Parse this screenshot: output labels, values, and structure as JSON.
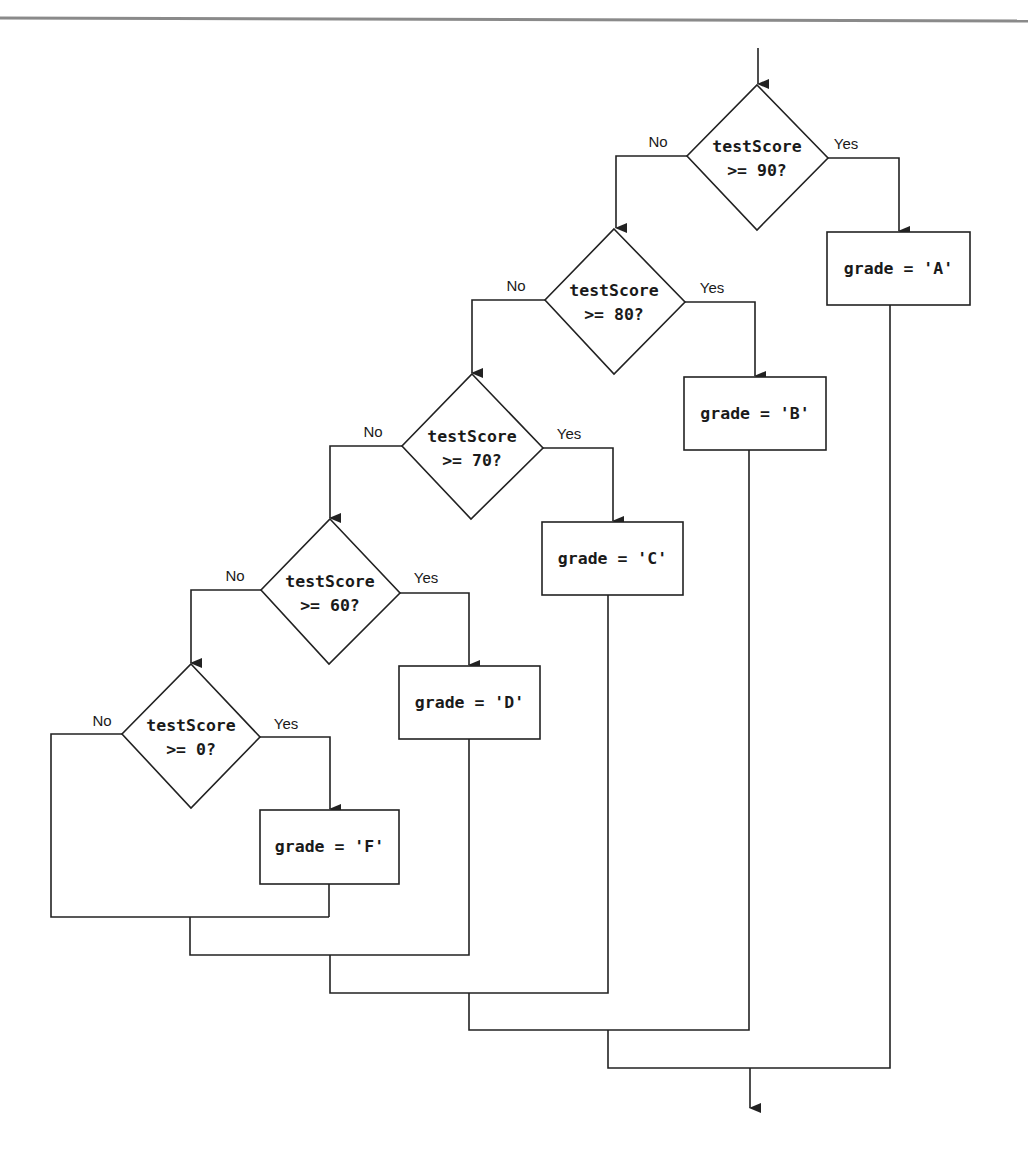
{
  "diagram": {
    "type": "flowchart",
    "decisions": [
      {
        "id": "d90",
        "line1": "testScore",
        "line2": ">= 90?",
        "no_label": "No",
        "yes_label": "Yes"
      },
      {
        "id": "d80",
        "line1": "testScore",
        "line2": ">= 80?",
        "no_label": "No",
        "yes_label": "Yes"
      },
      {
        "id": "d70",
        "line1": "testScore",
        "line2": ">= 70?",
        "no_label": "No",
        "yes_label": "Yes"
      },
      {
        "id": "d60",
        "line1": "testScore",
        "line2": ">= 60?",
        "no_label": "No",
        "yes_label": "Yes"
      },
      {
        "id": "d0",
        "line1": "testScore",
        "line2": ">= 0?",
        "no_label": "No",
        "yes_label": "Yes"
      }
    ],
    "processes": [
      {
        "id": "pA",
        "label": "grade = 'A'"
      },
      {
        "id": "pB",
        "label": "grade = 'B'"
      },
      {
        "id": "pC",
        "label": "grade = 'C'"
      },
      {
        "id": "pD",
        "label": "grade = 'D'"
      },
      {
        "id": "pF",
        "label": "grade = 'F'"
      }
    ],
    "edges": [
      {
        "from": "start",
        "to": "d90"
      },
      {
        "from": "d90",
        "to": "pA",
        "label": "Yes"
      },
      {
        "from": "d90",
        "to": "d80",
        "label": "No"
      },
      {
        "from": "d80",
        "to": "pB",
        "label": "Yes"
      },
      {
        "from": "d80",
        "to": "d70",
        "label": "No"
      },
      {
        "from": "d70",
        "to": "pC",
        "label": "Yes"
      },
      {
        "from": "d70",
        "to": "d60",
        "label": "No"
      },
      {
        "from": "d60",
        "to": "pD",
        "label": "Yes"
      },
      {
        "from": "d60",
        "to": "d0",
        "label": "No"
      },
      {
        "from": "d0",
        "to": "pF",
        "label": "Yes"
      },
      {
        "from": "d0",
        "to": "merge",
        "label": "No"
      },
      {
        "from": "pF",
        "to": "merge"
      },
      {
        "from": "pD",
        "to": "merge"
      },
      {
        "from": "pC",
        "to": "merge"
      },
      {
        "from": "pB",
        "to": "merge"
      },
      {
        "from": "pA",
        "to": "merge"
      },
      {
        "from": "merge",
        "to": "end"
      }
    ]
  }
}
